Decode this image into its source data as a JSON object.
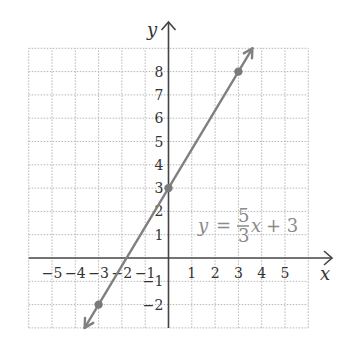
{
  "chart_data": {
    "type": "line",
    "title": "",
    "xlabel": "x",
    "ylabel": "y",
    "xlim": [
      -6,
      6
    ],
    "ylim": [
      -3,
      9
    ],
    "grid": true,
    "grid_style": "dotted",
    "x_ticks": [
      -5,
      -4,
      -3,
      -2,
      -1,
      1,
      2,
      3,
      4,
      5
    ],
    "y_ticks": [
      -2,
      -1,
      1,
      2,
      3,
      4,
      5,
      6,
      7,
      8
    ],
    "x_tick_labels": [
      "−5",
      "−4",
      "−3",
      "−2",
      "−1",
      "1",
      "2",
      "3",
      "4",
      "5"
    ],
    "y_tick_labels": [
      "−2",
      "−1",
      "1",
      "2",
      "3",
      "4",
      "5",
      "6",
      "7",
      "8"
    ],
    "series": [
      {
        "name": "y = 5/3 x + 3",
        "slope": 1.6667,
        "intercept": 3,
        "x": [
          -3.6,
          3.6
        ],
        "y": [
          -3,
          9
        ],
        "color": "#808080",
        "arrows": "both"
      }
    ],
    "points": [
      {
        "x": -3,
        "y": -2
      },
      {
        "x": 0,
        "y": 3
      },
      {
        "x": 3,
        "y": 8
      }
    ],
    "annotations": [
      {
        "text": "y = 5/3 x + 3",
        "x": 1.3,
        "y": 1.5
      }
    ]
  },
  "labels": {
    "x_axis": "x",
    "y_axis": "y",
    "equation": {
      "lhs": "y",
      "equals": "=",
      "numerator": "5",
      "denominator": "3",
      "var": "x",
      "rest": "+ 3"
    }
  },
  "colors": {
    "axis": "#444444",
    "grid": "#b5b5b5",
    "line": "#808080",
    "point": "#7a7a7a",
    "tick_text": "#333333",
    "equation_text": "#8a8a8a"
  }
}
